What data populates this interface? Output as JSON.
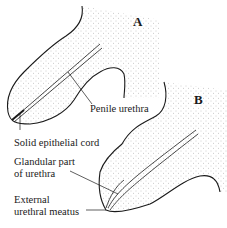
{
  "figure": {
    "panels": [
      {
        "id": "A",
        "label": "A"
      },
      {
        "id": "B",
        "label": "B"
      }
    ],
    "labels": {
      "penile_urethra": "Penile urethra",
      "solid_epithelial_cord": "Solid epithelial cord",
      "glandular_part_line1": "Glandular part",
      "glandular_part_line2": "of urethra",
      "external_meatus_line1": "External",
      "external_meatus_line2": "urethral meatus"
    },
    "colors": {
      "outline": "#1a1a1a",
      "stipple": "#9a9a9a",
      "background": "#ffffff"
    }
  }
}
